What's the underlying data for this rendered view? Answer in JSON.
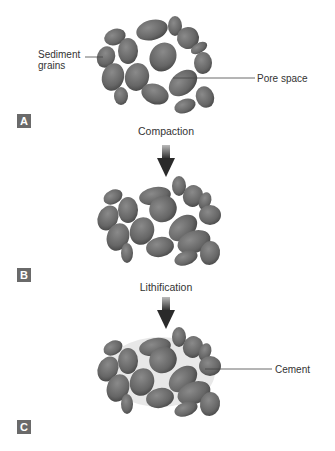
{
  "panels": [
    {
      "id": "A",
      "badge": "A",
      "labels": {
        "left": "Sediment grains",
        "left_line1": "Sediment",
        "left_line2": "grains",
        "right": "Pore space"
      }
    },
    {
      "id": "B",
      "badge": "B"
    },
    {
      "id": "C",
      "badge": "C",
      "labels": {
        "right": "Cement"
      }
    }
  ],
  "steps": [
    {
      "label": "Compaction"
    },
    {
      "label": "Lithification"
    }
  ],
  "colors": {
    "grain": "#6b6b6b",
    "grain_dark": "#4a4a4a",
    "badge": "#6a6a6a",
    "arrow": "#333333",
    "cement": "#e6e6e6"
  }
}
